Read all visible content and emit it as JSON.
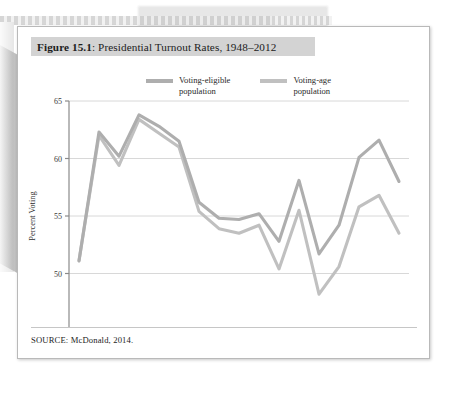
{
  "figure": {
    "label": "Figure 15.1",
    "title_prefix": "Figure 15.1",
    "title_rest": ": Presidential Turnout Rates, 1948–2012",
    "source": "SOURCE: McDonald, 2014."
  },
  "colors": {
    "series_eligible": "#aeaeae",
    "series_age": "#c0c0c0",
    "axis": "#8a8a8a",
    "grid": "#d8d8d8",
    "title_band": "#d3d3d3",
    "card_border": "#b9b9b9",
    "text": "#232323"
  },
  "legend": {
    "position": "top-center",
    "items": [
      {
        "label": "Voting-eligible\npopulation",
        "color": "#aeaeae",
        "series": "voting_eligible"
      },
      {
        "label": "Voting-age\npopulation",
        "color": "#c0c0c0",
        "series": "voting_age"
      }
    ]
  },
  "chart_data": {
    "type": "line",
    "title": "Presidential Turnout Rates, 1948–2012",
    "xlabel": "Year",
    "ylabel": "Percent Voting",
    "xlim": [
      1946,
      2014
    ],
    "ylim": [
      45,
      65
    ],
    "yticks": [
      45,
      50,
      55,
      60,
      65
    ],
    "ytick_labels": [
      "45",
      "50",
      "55",
      "60",
      "65"
    ],
    "xticks": [
      1948,
      1956,
      1964,
      1972,
      1980,
      1988,
      1996,
      2004,
      2012
    ],
    "xtick_labels": [
      "1948",
      "1956",
      "1964",
      "1972",
      "1980",
      "1988",
      "1996",
      "2004",
      "2012"
    ],
    "x_minor_ticks": [
      1952,
      1960,
      1968,
      1976,
      1984,
      1992,
      2000,
      2008
    ],
    "grid": "horizontal",
    "x": [
      1948,
      1952,
      1956,
      1960,
      1964,
      1968,
      1972,
      1976,
      1980,
      1984,
      1988,
      1992,
      1996,
      2000,
      2004,
      2008,
      2012
    ],
    "series": [
      {
        "name": "Voting-eligible population",
        "color": "#aeaeae",
        "values": [
          51.1,
          62.3,
          60.2,
          63.8,
          62.8,
          61.5,
          56.2,
          54.8,
          54.7,
          55.2,
          52.8,
          58.1,
          51.7,
          54.2,
          60.1,
          61.6,
          58.0
        ]
      },
      {
        "name": "Voting-age population",
        "color": "#c0c0c0",
        "values": [
          51.1,
          62.0,
          59.4,
          63.4,
          62.2,
          61.0,
          55.4,
          53.9,
          53.5,
          54.2,
          50.4,
          55.5,
          48.2,
          50.6,
          55.8,
          56.8,
          53.5
        ]
      }
    ]
  }
}
